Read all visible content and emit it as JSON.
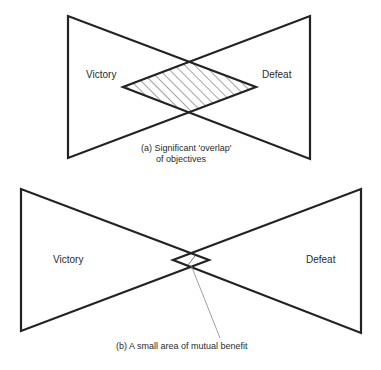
{
  "diagram_a": {
    "left_label": "Victory",
    "right_label": "Defeat",
    "caption_line1": "(a) Significant 'overlap'",
    "caption_line2": "of objectives",
    "overlap_fill": "hatched"
  },
  "diagram_b": {
    "left_label": "Victory",
    "right_label": "Defeat",
    "caption": "(b) A small area of mutual benefit"
  },
  "colors": {
    "stroke": "#222222",
    "text": "#2a2a2a",
    "leader": "#888888",
    "background": "#ffffff"
  }
}
